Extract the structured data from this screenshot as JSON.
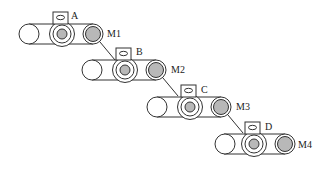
{
  "diagram": {
    "type": "cascaded belt conveyor modules",
    "colors": {
      "stroke": "#333333",
      "fill_core": "#b8b8b8",
      "background": "#ffffff"
    },
    "modules": [
      {
        "id": "A",
        "label": "A",
        "motor_label": "M1"
      },
      {
        "id": "B",
        "label": "B",
        "motor_label": "M2"
      },
      {
        "id": "C",
        "label": "C",
        "motor_label": "M3"
      },
      {
        "id": "D",
        "label": "D",
        "motor_label": "M4"
      }
    ]
  }
}
